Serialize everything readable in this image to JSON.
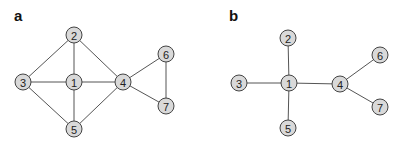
{
  "panels": [
    {
      "label": "a",
      "label_pos": [
        14,
        21
      ],
      "nodes": [
        {
          "id": "1",
          "x": 74,
          "y": 82
        },
        {
          "id": "2",
          "x": 74,
          "y": 35
        },
        {
          "id": "3",
          "x": 23,
          "y": 82
        },
        {
          "id": "4",
          "x": 123,
          "y": 82
        },
        {
          "id": "5",
          "x": 74,
          "y": 129
        },
        {
          "id": "6",
          "x": 166,
          "y": 54
        },
        {
          "id": "7",
          "x": 166,
          "y": 106
        }
      ],
      "edges": [
        [
          "1",
          "2"
        ],
        [
          "1",
          "3"
        ],
        [
          "1",
          "4"
        ],
        [
          "1",
          "5"
        ],
        [
          "2",
          "3"
        ],
        [
          "2",
          "4"
        ],
        [
          "3",
          "5"
        ],
        [
          "4",
          "5"
        ],
        [
          "4",
          "6"
        ],
        [
          "4",
          "7"
        ],
        [
          "6",
          "7"
        ]
      ]
    },
    {
      "label": "b",
      "label_pos": [
        229,
        21
      ],
      "nodes": [
        {
          "id": "1",
          "x": 289,
          "y": 83
        },
        {
          "id": "2",
          "x": 288,
          "y": 38
        },
        {
          "id": "3",
          "x": 239,
          "y": 83
        },
        {
          "id": "4",
          "x": 340,
          "y": 84
        },
        {
          "id": "5",
          "x": 288,
          "y": 128
        },
        {
          "id": "6",
          "x": 380,
          "y": 55
        },
        {
          "id": "7",
          "x": 380,
          "y": 107
        }
      ],
      "edges": [
        [
          "1",
          "2"
        ],
        [
          "1",
          "3"
        ],
        [
          "1",
          "4"
        ],
        [
          "1",
          "5"
        ],
        [
          "4",
          "6"
        ],
        [
          "4",
          "7"
        ]
      ]
    }
  ],
  "style": {
    "node_radius": 8,
    "node_fill": "#d9d9d9",
    "node_stroke": "#444444",
    "edge_color": "#555555"
  }
}
